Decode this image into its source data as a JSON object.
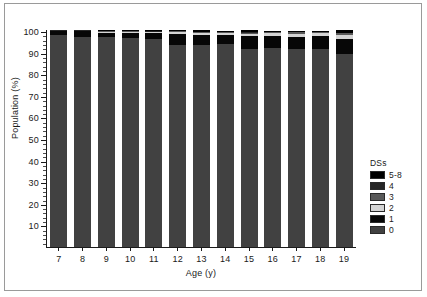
{
  "figure": {
    "background_color": "#ffffff",
    "frame_color": "#9a9a9a"
  },
  "axis": {
    "y_title": "Population (%)",
    "x_title": "Age (y)",
    "y_ticks": [
      "100",
      "90",
      "80",
      "70",
      "60",
      "50",
      "40",
      "30",
      "20",
      "10"
    ]
  },
  "legend": {
    "title": "DSs",
    "entries": [
      {
        "label": "5-8",
        "color": "#000000"
      },
      {
        "label": "4",
        "color": "#262626"
      },
      {
        "label": "3",
        "color": "#595959"
      },
      {
        "label": "2",
        "color": "#d4d4d4"
      },
      {
        "label": "1",
        "color": "#070707"
      },
      {
        "label": "0",
        "color": "#414141"
      }
    ]
  },
  "chart_data": {
    "type": "bar",
    "title": "",
    "subtitle": "",
    "stacked": true,
    "stack_mode": "percent",
    "xlabel": "Age (y)",
    "ylabel": "Population (%)",
    "ylim": [
      0,
      101
    ],
    "y_major_step": 10,
    "y_minor_step": 2,
    "grid": false,
    "legend_position": "right",
    "legend_title": "DSs",
    "categories": [
      "7",
      "8",
      "9",
      "10",
      "11",
      "12",
      "13",
      "14",
      "15",
      "16",
      "17",
      "18",
      "19"
    ],
    "series": [
      {
        "name": "0",
        "color": "#414141",
        "values": [
          98.6,
          97.8,
          97.5,
          97.2,
          96.9,
          94.0,
          94.0,
          94.2,
          92.0,
          92.2,
          91.6,
          91.6,
          89.6
        ]
      },
      {
        "name": "1",
        "color": "#070707",
        "values": [
          1.8,
          2.5,
          2.1,
          2.3,
          2.5,
          5.2,
          4.6,
          4.1,
          6.2,
          5.6,
          5.8,
          6.2,
          7.0
        ]
      },
      {
        "name": "2",
        "color": "#d4d4d4",
        "values": [
          0.2,
          0.3,
          0.5,
          0.6,
          0.6,
          0.8,
          1.0,
          0.9,
          1.1,
          1.2,
          1.5,
          1.2,
          2.2
        ]
      },
      {
        "name": "3",
        "color": "#595959",
        "values": [
          0.1,
          0.1,
          0.2,
          0.2,
          0.2,
          0.3,
          0.4,
          0.3,
          0.4,
          0.4,
          0.5,
          0.4,
          0.6
        ]
      },
      {
        "name": "4",
        "color": "#262626",
        "values": [
          0.1,
          0.1,
          0.1,
          0.1,
          0.1,
          0.2,
          0.2,
          0.2,
          0.3,
          0.3,
          0.3,
          0.3,
          0.4
        ]
      },
      {
        "name": "5-8",
        "color": "#000000",
        "values": [
          0.2,
          0.2,
          0.6,
          0.6,
          0.7,
          0.5,
          0.8,
          0.3,
          1.0,
          0.3,
          0.3,
          0.3,
          1.2
        ]
      }
    ]
  }
}
